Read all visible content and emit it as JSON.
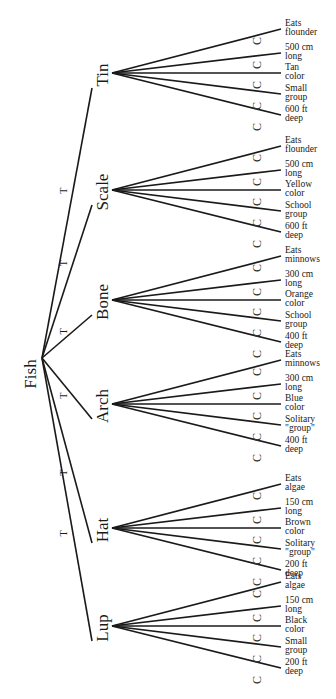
{
  "root": {
    "label": "Fish"
  },
  "edge_marker": "T",
  "leaf_marker": "C",
  "groups": [
    {
      "label": "Tin",
      "leaves": [
        [
          "Eats",
          "flounder"
        ],
        [
          "500 cm",
          "long"
        ],
        [
          "Tan",
          "color"
        ],
        [
          "Small",
          "group"
        ],
        [
          "600 ft",
          "deep"
        ]
      ]
    },
    {
      "label": "Scale",
      "leaves": [
        [
          "Eats",
          "flounder"
        ],
        [
          "500 cm",
          "long"
        ],
        [
          "Yellow",
          "color"
        ],
        [
          "School",
          "group"
        ],
        [
          "600 ft",
          "deep"
        ]
      ]
    },
    {
      "label": "Bone",
      "leaves": [
        [
          "Eats",
          "minnows"
        ],
        [
          "300 cm",
          "long"
        ],
        [
          "Orange",
          "color"
        ],
        [
          "School",
          "group"
        ],
        [
          "400 ft",
          "deep"
        ]
      ]
    },
    {
      "label": "Arch",
      "leaves": [
        [
          "Eats",
          "minnows"
        ],
        [
          "300 cm",
          "long"
        ],
        [
          "Blue",
          "color"
        ],
        [
          "Solitary",
          "\"group\""
        ],
        [
          "400 ft",
          "deep"
        ]
      ]
    },
    {
      "label": "Hat",
      "leaves": [
        [
          "Eats",
          "algae"
        ],
        [
          "150 cm",
          "long"
        ],
        [
          "Brown",
          "color"
        ],
        [
          "Solitary",
          "\"group\""
        ],
        [
          "200 ft",
          "deep"
        ]
      ]
    },
    {
      "label": "Lup",
      "leaves": [
        [
          "Eats",
          "algae"
        ],
        [
          "150 cm",
          "long"
        ],
        [
          "Black",
          "color"
        ],
        [
          "Small",
          "group"
        ],
        [
          "200 ft",
          "deep"
        ]
      ]
    }
  ]
}
